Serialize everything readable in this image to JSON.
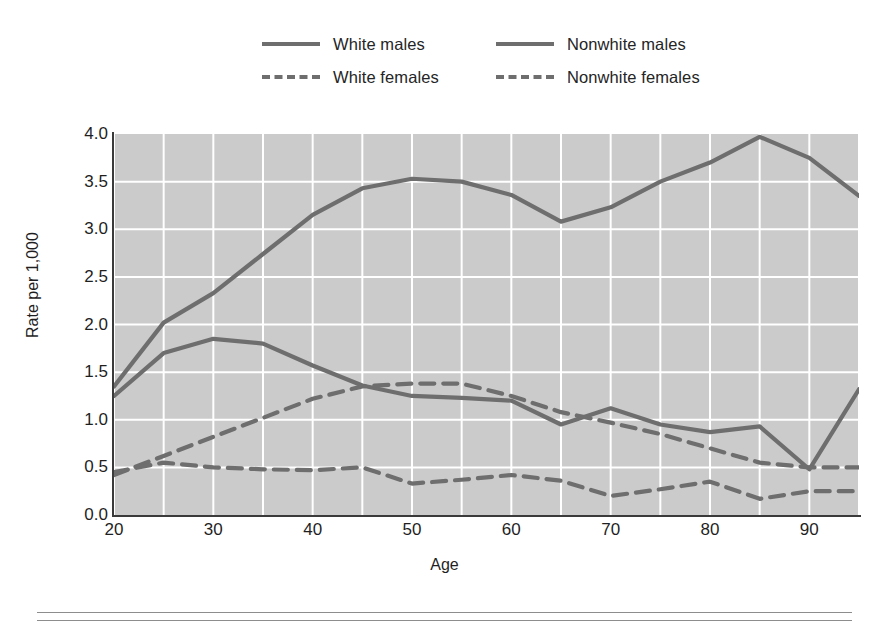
{
  "chart_data": {
    "type": "line",
    "title": "",
    "xlabel": "Age",
    "ylabel": "Rate per 1,000",
    "xlim": [
      20,
      95
    ],
    "ylim": [
      0.0,
      4.0
    ],
    "grid": true,
    "grid_x_step": 5,
    "grid_y_step": 0.5,
    "legend_position": "top-center",
    "x": [
      20,
      25,
      30,
      35,
      40,
      45,
      50,
      55,
      60,
      65,
      70,
      75,
      80,
      85,
      90,
      95
    ],
    "xtick_labels": [
      "20",
      "30",
      "40",
      "50",
      "60",
      "70",
      "80",
      "90"
    ],
    "xtick_values": [
      20,
      30,
      40,
      50,
      60,
      70,
      80,
      90
    ],
    "ytick_labels": [
      "0.0",
      "0.5",
      "1.0",
      "1.5",
      "2.0",
      "2.5",
      "3.0",
      "3.5",
      "4.0"
    ],
    "ytick_values": [
      0.0,
      0.5,
      1.0,
      1.5,
      2.0,
      2.5,
      3.0,
      3.5,
      4.0
    ],
    "series": [
      {
        "name": "White males",
        "style": "solid",
        "color": "#6e6e6e",
        "values": [
          1.35,
          2.02,
          2.33,
          2.74,
          3.15,
          3.43,
          3.53,
          3.5,
          3.36,
          3.08,
          3.23,
          3.5,
          3.7,
          3.97,
          3.75,
          3.35
        ]
      },
      {
        "name": "Nonwhite males",
        "style": "solid",
        "color": "#6e6e6e",
        "values": [
          1.25,
          1.7,
          1.85,
          1.8,
          1.57,
          1.36,
          1.25,
          1.23,
          1.2,
          0.95,
          1.12,
          0.95,
          0.87,
          0.93,
          0.48,
          1.32
        ]
      },
      {
        "name": "White females",
        "style": "dashed",
        "color": "#6e6e6e",
        "values": [
          0.42,
          0.62,
          0.82,
          1.02,
          1.22,
          1.35,
          1.38,
          1.38,
          1.25,
          1.08,
          0.97,
          0.85,
          0.7,
          0.55,
          0.5,
          0.5
        ]
      },
      {
        "name": "Nonwhite females",
        "style": "dashed",
        "color": "#6e6e6e",
        "values": [
          0.45,
          0.55,
          0.5,
          0.48,
          0.47,
          0.5,
          0.33,
          0.37,
          0.42,
          0.36,
          0.2,
          0.27,
          0.35,
          0.17,
          0.25,
          0.25
        ]
      }
    ]
  },
  "legend": {
    "items": [
      {
        "label": "White males"
      },
      {
        "label": "Nonwhite males"
      },
      {
        "label": "White females"
      },
      {
        "label": "Nonwhite females"
      }
    ]
  },
  "axes": {
    "y_label": "Rate per 1,000",
    "x_label": "Age"
  }
}
